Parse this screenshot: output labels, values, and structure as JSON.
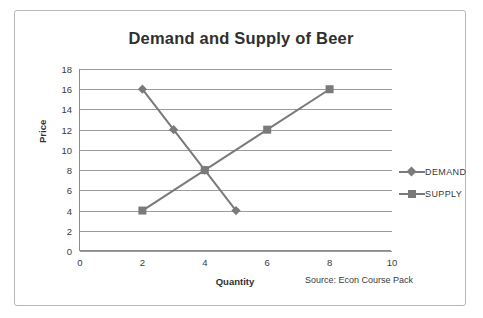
{
  "chart_data": {
    "type": "line",
    "title": "Demand and Supply of Beer",
    "xlabel": "Quantity",
    "ylabel": "Price",
    "xlim": [
      0,
      10
    ],
    "ylim": [
      0,
      18
    ],
    "xticks": [
      0,
      2,
      4,
      6,
      8,
      10
    ],
    "yticks": [
      0,
      2,
      4,
      6,
      8,
      10,
      12,
      14,
      16,
      18
    ],
    "grid": "horizontal",
    "legend_position": "right",
    "series": [
      {
        "name": "DEMAND",
        "color": "#7a7a7a",
        "marker": "diamond",
        "x": [
          2,
          3,
          4,
          5
        ],
        "y": [
          16,
          12,
          8,
          4
        ]
      },
      {
        "name": "SUPPLY",
        "color": "#7a7a7a",
        "marker": "square",
        "x": [
          2,
          4,
          6,
          8
        ],
        "y": [
          4,
          8,
          12,
          16
        ]
      }
    ],
    "annotations": [
      {
        "text": "Source: Econ Course Pack"
      }
    ]
  },
  "source_note": "Source: Econ Course Pack"
}
